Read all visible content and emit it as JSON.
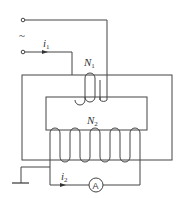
{
  "diagram": {
    "type": "current transformer circuit",
    "source_symbol": "~",
    "labels": {
      "i1_main": "i",
      "i1_sub": "1",
      "i2_main": "i",
      "i2_sub": "2",
      "N1_main": "N",
      "N1_sub": "1",
      "N2_main": "N",
      "N2_sub": "2",
      "ammeter": "A"
    },
    "components": [
      "AC source terminals",
      "primary winding N1",
      "secondary winding N2",
      "core",
      "ammeter",
      "ground"
    ],
    "colors": {
      "line": "#444444",
      "text": "#333333",
      "background": "#ffffff"
    }
  }
}
